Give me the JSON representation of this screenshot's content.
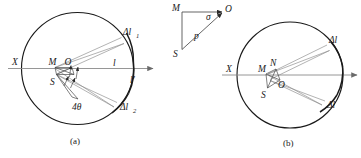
{
  "figure": {
    "panels": [
      {
        "id": "a",
        "caption": "(a)",
        "axis_label": "X",
        "points": [
          {
            "name": "M",
            "label": "M"
          },
          {
            "name": "S",
            "label": "S"
          },
          {
            "name": "O",
            "label": "O"
          }
        ],
        "annotations": [
          {
            "name": "delta-l-1",
            "base": "Δl",
            "sub": "1"
          },
          {
            "name": "delta-l-2",
            "base": "Δl",
            "sub": "2"
          },
          {
            "name": "arc-l",
            "label": "l"
          },
          {
            "name": "arc-l-prime",
            "label": "l′"
          },
          {
            "name": "angle-4theta",
            "label": "4θ"
          }
        ]
      },
      {
        "id": "b",
        "caption": "(b)",
        "axis_label": "X",
        "points": [
          {
            "name": "M",
            "label": "M"
          },
          {
            "name": "N",
            "label": "N"
          },
          {
            "name": "O",
            "label": "O"
          },
          {
            "name": "S",
            "label": "S"
          }
        ],
        "annotations": [
          {
            "name": "delta-l-upper",
            "label": "Δl"
          },
          {
            "name": "delta-l-lower",
            "label": "Δl"
          }
        ]
      }
    ],
    "inset_triangle": {
      "name": "inset-triangle",
      "vertices": [
        {
          "name": "M",
          "label": "M"
        },
        {
          "name": "O",
          "label": "O"
        },
        {
          "name": "S",
          "label": "S"
        }
      ],
      "angle_label": "σ",
      "side_label": "p"
    },
    "colors": {
      "ink": "#1a1a1a",
      "rule": "#8a8a8a",
      "ray": "#8a8a8a",
      "background": "#ffffff"
    }
  }
}
